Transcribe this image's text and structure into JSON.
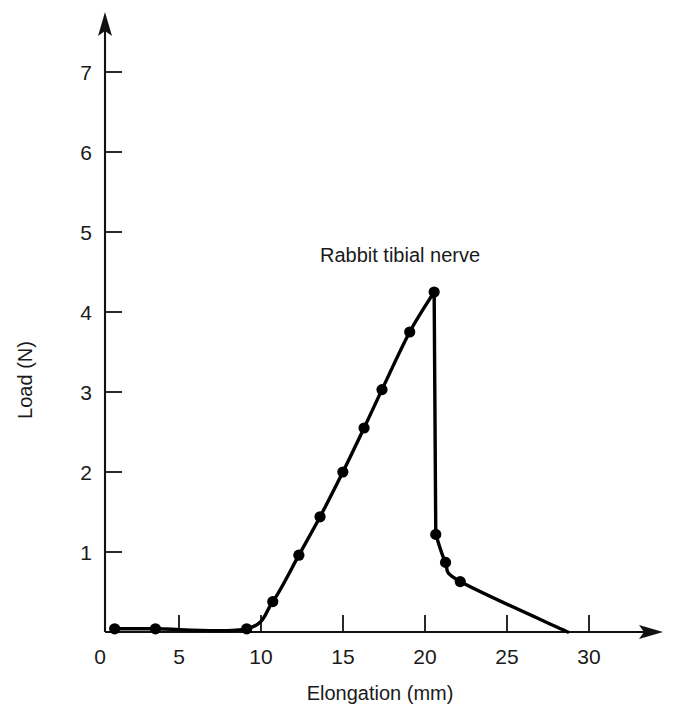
{
  "chart_data": {
    "type": "line",
    "title": "",
    "xlabel": "Elongation (mm)",
    "ylabel": "Load (N)",
    "xlim": [
      0,
      33.5
    ],
    "ylim": [
      0,
      7.6
    ],
    "xticks": [
      0,
      5,
      10,
      15,
      20,
      25,
      30
    ],
    "xtick_labels": [
      "0",
      "5",
      "10",
      "15",
      "20",
      "25",
      "30"
    ],
    "yticks": [
      1,
      2,
      3,
      4,
      5,
      6,
      7
    ],
    "ytick_labels": [
      "1",
      "2",
      "3",
      "4",
      "5",
      "6",
      "7"
    ],
    "grid": false,
    "legend": "none",
    "annotations": [
      {
        "text": "Rabbit tibial nerve",
        "x": 16.5,
        "y": 5.05
      }
    ],
    "series": [
      {
        "name": "Rabbit tibial nerve",
        "marker": "filled-circle",
        "markers_shown": true,
        "x": [
          0.9,
          3.4,
          9.0,
          10.6,
          12.2,
          13.5,
          14.9,
          16.2,
          17.3,
          19.0,
          20.5,
          20.6,
          21.2,
          22.1,
          28.7
        ],
        "y": [
          0.04,
          0.04,
          0.04,
          0.38,
          0.96,
          1.44,
          2.0,
          2.55,
          3.03,
          3.75,
          4.25,
          1.22,
          0.87,
          0.63,
          0.0
        ],
        "marker_points": [
          {
            "x": 0.9,
            "y": 0.04
          },
          {
            "x": 3.4,
            "y": 0.04
          },
          {
            "x": 9.0,
            "y": 0.04
          },
          {
            "x": 10.6,
            "y": 0.38
          },
          {
            "x": 12.2,
            "y": 0.96
          },
          {
            "x": 13.5,
            "y": 1.44
          },
          {
            "x": 14.9,
            "y": 2.0
          },
          {
            "x": 16.2,
            "y": 2.55
          },
          {
            "x": 17.3,
            "y": 3.03
          },
          {
            "x": 19.0,
            "y": 3.75
          },
          {
            "x": 20.5,
            "y": 4.25
          },
          {
            "x": 20.6,
            "y": 1.22
          },
          {
            "x": 21.2,
            "y": 0.87
          },
          {
            "x": 22.1,
            "y": 0.63
          }
        ]
      }
    ],
    "colors": {
      "curve": "#000000",
      "axis": "#111111",
      "text": "#1a1a1a",
      "background": "#ffffff"
    }
  },
  "axes": {
    "x_axis_name": "elongation-axis",
    "y_axis_name": "load-axis",
    "x_arrow": true,
    "y_arrow": true
  }
}
